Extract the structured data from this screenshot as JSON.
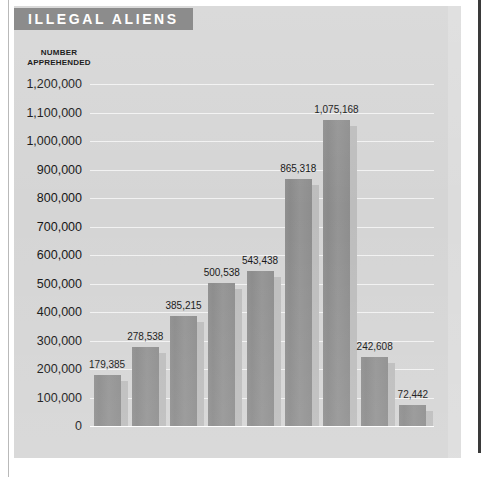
{
  "figure": {
    "title": "ILLEGAL ALIENS",
    "axis_caption_line1": "NUMBER",
    "axis_caption_line2": "APPREHENDED",
    "colors": {
      "panel_background": "#d5d5d5",
      "banner": "#8c8c8c",
      "banner_text": "#ffffff",
      "bar_fill": "#909090",
      "bar_shadow": "#bdbdbd",
      "gridline": "#f2f2f2",
      "text": "#141414"
    }
  },
  "chart_data": {
    "type": "bar",
    "title": "ILLEGAL ALIENS",
    "xlabel": "",
    "ylabel": "NUMBER APPREHENDED",
    "ylim": [
      0,
      1200000
    ],
    "ytick_step": 100000,
    "grid": true,
    "legend": "none",
    "categories": [
      "1948",
      "1949",
      "1950",
      "1951",
      "1952",
      "1953",
      "1954",
      "1955",
      "1956"
    ],
    "values": [
      179385,
      278538,
      385215,
      500538,
      543438,
      865318,
      1075168,
      242608,
      72442
    ],
    "value_labels": [
      "179,385",
      "278,538",
      "385,215",
      "500,538",
      "543,438",
      "865,318",
      "1,075,168",
      "242,608",
      "72,442"
    ],
    "ytick_labels": [
      "1,200,000",
      "1,100,000",
      "1,000,000",
      "900,000",
      "800,000",
      "700,000",
      "600,000",
      "500,000",
      "400,000",
      "300,000",
      "200,000",
      "100,000",
      "0"
    ],
    "ytick_values": [
      1200000,
      1100000,
      1000000,
      900000,
      800000,
      700000,
      600000,
      500000,
      400000,
      300000,
      200000,
      100000,
      0
    ]
  }
}
